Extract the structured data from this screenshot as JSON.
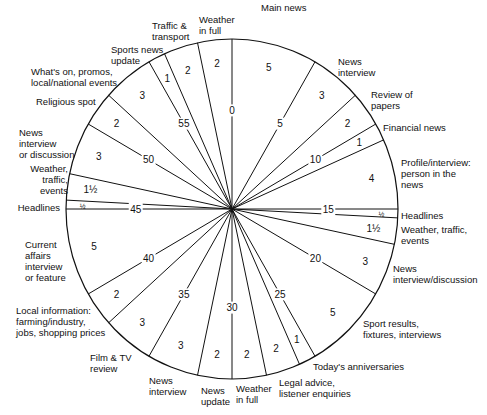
{
  "chart_data": {
    "type": "pie",
    "unit": "minutes",
    "total": 60,
    "start_angle": "12 o'clock, clockwise",
    "minute_ticks": [
      "0",
      "5",
      "10",
      "15",
      "20",
      "25",
      "30",
      "35",
      "40",
      "45",
      "50",
      "55"
    ],
    "segments": [
      {
        "label": "Main news",
        "start": 0,
        "minutes": 5,
        "value_label": "5"
      },
      {
        "label": "News interview",
        "start": 5,
        "minutes": 3,
        "value_label": "3"
      },
      {
        "label": "Review of papers",
        "start": 8,
        "minutes": 2,
        "value_label": "2"
      },
      {
        "label": "Financial news",
        "start": 10,
        "minutes": 1,
        "value_label": "1"
      },
      {
        "label": "Profile/interview: person in the news",
        "start": 11,
        "minutes": 4,
        "value_label": "4"
      },
      {
        "label": "Headlines",
        "start": 15,
        "minutes": 0.5,
        "value_label": "½"
      },
      {
        "label": "Weather, traffic, events",
        "start": 15.5,
        "minutes": 1.5,
        "value_label": "1½"
      },
      {
        "label": "News interview/discussion",
        "start": 17,
        "minutes": 3,
        "value_label": "3"
      },
      {
        "label": "Sport results, fixtures, interviews",
        "start": 20,
        "minutes": 5,
        "value_label": "5"
      },
      {
        "label": "Today's anniversaries",
        "start": 25,
        "minutes": 1,
        "value_label": "1"
      },
      {
        "label": "Legal advice, listener enquiries",
        "start": 26,
        "minutes": 2,
        "value_label": "2"
      },
      {
        "label": "Weather in full",
        "start": 28,
        "minutes": 2,
        "value_label": "2"
      },
      {
        "label": "News update",
        "start": 30,
        "minutes": 2,
        "value_label": "2"
      },
      {
        "label": "News interview",
        "start": 32,
        "minutes": 3,
        "value_label": "3"
      },
      {
        "label": "Film & TV review",
        "start": 35,
        "minutes": 3,
        "value_label": "3"
      },
      {
        "label": "Local information: farming/industry, jobs, shopping prices",
        "start": 38,
        "minutes": 2,
        "value_label": "2"
      },
      {
        "label": "Current affairs interview or feature",
        "start": 40,
        "minutes": 5,
        "value_label": "5"
      },
      {
        "label": "Headlines",
        "start": 45,
        "minutes": 0.5,
        "value_label": "½"
      },
      {
        "label": "Weather, traffic, events",
        "start": 45.5,
        "minutes": 1.5,
        "value_label": "1½"
      },
      {
        "label": "News interview or discussion",
        "start": 47,
        "minutes": 3,
        "value_label": "3"
      },
      {
        "label": "Religious spot",
        "start": 50,
        "minutes": 2,
        "value_label": "2"
      },
      {
        "label": "What's on, promos, local/national events",
        "start": 52,
        "minutes": 3,
        "value_label": "3"
      },
      {
        "label": "Sports news update",
        "start": 55,
        "minutes": 1,
        "value_label": "1"
      },
      {
        "label": "Traffic & transport",
        "start": 56,
        "minutes": 2,
        "value_label": "2"
      },
      {
        "label": "Weather in full",
        "start": 58,
        "minutes": 2,
        "value_label": "2"
      }
    ]
  },
  "labels": {
    "main_news": "Main news",
    "news_interview_1": "News\ninterview",
    "review_papers": "Review of\npapers",
    "financial_news": "Financial news",
    "profile": "Profile/interview:\nperson in the\nnews",
    "headlines_1": "Headlines",
    "weather_traffic_1": "Weather, traffic,\nevents",
    "news_interview_discussion": "News\ninterview/discussion",
    "sport_results": "Sport results,\nfixtures, interviews",
    "anniversaries": "Today's anniversaries",
    "legal_advice": "Legal advice,\nlistener enquiries",
    "weather_full_1": "Weather\nin full",
    "news_update": "News\nupdate",
    "news_interview_2": "News\ninterview",
    "film_tv": "Film & TV\nreview",
    "local_info": "Local information:\nfarming/industry,\njobs, shopping prices",
    "current_affairs": "Current\naffairs\ninterview\nor feature",
    "headlines_2": "Headlines",
    "weather_traffic_2": "Weather,\ntraffic,\nevents",
    "news_interview_or_discussion": "News\ninterview\nor discussion",
    "religious_spot": "Religious spot",
    "whats_on": "What's on, promos,\nlocal/national events",
    "sports_news_update": "Sports news\nupdate",
    "traffic_transport": "Traffic &\ntransport",
    "weather_full_2": "Weather\nin full"
  }
}
